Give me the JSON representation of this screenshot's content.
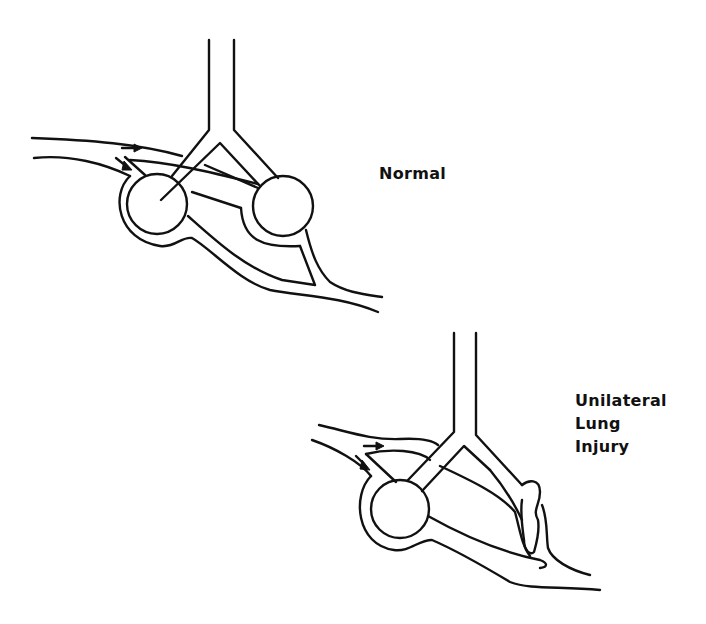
{
  "figure": {
    "panels": [
      {
        "id": "normal",
        "label": "Normal"
      },
      {
        "id": "unilateral",
        "label_lines": [
          "Unilateral",
          "Lung",
          "Injury"
        ]
      }
    ],
    "colors": {
      "line": "#111111",
      "background": "#ffffff"
    }
  }
}
